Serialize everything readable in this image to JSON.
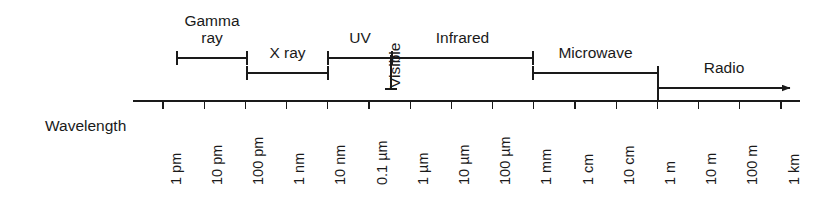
{
  "figure": {
    "axis_caption": "Wavelength",
    "axis": {
      "x_start": 133,
      "x_end": 800,
      "y": 101,
      "tick_height": 8,
      "tick_spacing": 41.2,
      "first_tick_x": 163
    },
    "tick_labels": [
      "1 pm",
      "10 pm",
      "100 pm",
      "1 nm",
      "10 nm",
      "0.1 µm",
      "1 µm",
      "10 µm",
      "100 µm",
      "1 mm",
      "1 cm",
      "10 cm",
      "1 m",
      "10 m",
      "100 m",
      "1 km"
    ],
    "bands": [
      {
        "name": "gamma-ray",
        "label": "Gamma\nray",
        "label_lines": [
          "Gamma",
          "ray"
        ],
        "x_start": 177,
        "x_end": 247,
        "bracket_y": 58,
        "label_y": 12,
        "capped_both_ends": true,
        "arrow": false
      },
      {
        "name": "x-ray",
        "label": "X ray",
        "label_lines": [
          "X ray"
        ],
        "x_start": 247,
        "x_end": 328,
        "bracket_y": 73,
        "label_y": 44,
        "capped_both_ends": true,
        "arrow": false
      },
      {
        "name": "uv",
        "label": "UV",
        "label_lines": [
          "UV"
        ],
        "x_start": 328,
        "x_end": 392,
        "bracket_y": 58,
        "label_y": 29,
        "capped_both_ends": true,
        "arrow": false
      },
      {
        "name": "infrared",
        "label": "Infrared",
        "label_lines": [
          "Infrared"
        ],
        "x_start": 392,
        "x_end": 533,
        "bracket_y": 58,
        "label_y": 29,
        "capped_both_ends": true,
        "arrow": false
      },
      {
        "name": "microwave",
        "label": "Microwave",
        "label_lines": [
          "Microwave"
        ],
        "x_start": 533,
        "x_end": 658,
        "bracket_y": 73,
        "label_y": 44,
        "capped_both_ends": true,
        "arrow": false
      },
      {
        "name": "radio",
        "label": "Radio",
        "label_lines": [
          "Radio"
        ],
        "x_start": 658,
        "x_end": 790,
        "bracket_y": 88,
        "label_y": 59,
        "capped_both_ends": false,
        "arrow": true
      }
    ],
    "vertical_band": {
      "name": "visible",
      "label": "Visible",
      "x": 391,
      "y_top": 55,
      "y_bottom": 89,
      "text_x": 387,
      "text_y": 88
    },
    "colors": {
      "line": "#1a1a1a",
      "text": "#1a1a1a",
      "background": "#ffffff"
    }
  }
}
